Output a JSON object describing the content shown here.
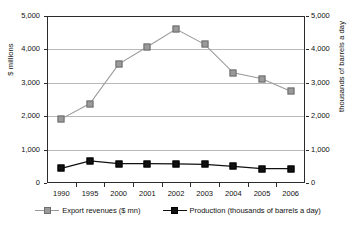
{
  "chart_data": {
    "type": "line",
    "title": "",
    "xlabel": "",
    "ylabel": "$ millions",
    "y2label": "thousands of barrels a day",
    "categories": [
      "1990",
      "1995",
      "2000",
      "2001",
      "2002",
      "2003",
      "2004",
      "2005",
      "2006"
    ],
    "ylim": [
      0,
      5000
    ],
    "y2lim": [
      0,
      5000
    ],
    "yticks": [
      "0",
      "1,000",
      "2,000",
      "3,000",
      "4,000",
      "5,000"
    ],
    "ytick_values": [
      0,
      1000,
      2000,
      3000,
      4000,
      5000
    ],
    "y2ticks": [
      "0",
      "1,000",
      "2,000",
      "3,000",
      "4,000",
      "5,000"
    ],
    "grid": true,
    "legend_position": "bottom",
    "series": [
      {
        "name": "Export revenues ($ mn)",
        "axis": "left",
        "color": "#9a9a9a",
        "marker": "square",
        "values": [
          1920,
          2380,
          3560,
          4080,
          4610,
          4150,
          3300,
          3120,
          2750
        ]
      },
      {
        "name": "Production (thousands of barrels a day)",
        "axis": "right",
        "color": "#111111",
        "marker": "square",
        "values": [
          440,
          660,
          580,
          580,
          570,
          560,
          500,
          430,
          430
        ]
      }
    ]
  }
}
